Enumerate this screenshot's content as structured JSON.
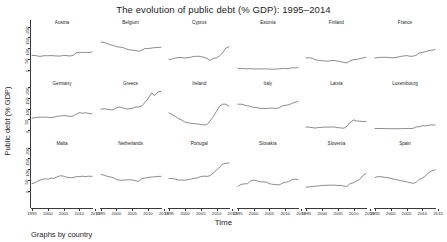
{
  "chart": {
    "title": "The evolution of public debt (% GDP): 1995–2014",
    "xlabel": "Time",
    "ylabel": "Public debt (% GDP)",
    "caption": "Graphs by country"
  },
  "chart_data": {
    "type": "line",
    "title": "The evolution of public debt (% GDP): 1995–2014",
    "xlabel": "Time",
    "ylabel": "Public debt (% GDP)",
    "caption": "Graphs by country",
    "layout": "small-multiples 3 rows × 6 columns, shared axes",
    "grid": false,
    "legend": "none",
    "xlim": [
      1995,
      2014
    ],
    "ylim": [
      0,
      200
    ],
    "xticks": [
      1995,
      2000,
      2005,
      2010,
      2015
    ],
    "yticks": [
      0,
      50,
      100,
      150,
      200
    ],
    "xtick_labels": [
      "1995",
      "2000",
      "2005",
      "2010",
      "2015"
    ],
    "ytick_labels": [
      "0",
      "50",
      "100",
      "150",
      "200"
    ],
    "x": [
      1995,
      1996,
      1997,
      1998,
      1999,
      2000,
      2001,
      2002,
      2003,
      2004,
      2005,
      2006,
      2007,
      2008,
      2009,
      2010,
      2011,
      2012,
      2013,
      2014
    ],
    "series": [
      {
        "name": "Austria",
        "row": 0,
        "col": 0,
        "values": [
          68,
          68,
          64,
          64,
          67,
          66,
          67,
          66,
          65,
          65,
          68,
          67,
          65,
          68,
          80,
          82,
          82,
          82,
          81,
          84
        ]
      },
      {
        "name": "Belgium",
        "row": 0,
        "col": 1,
        "values": [
          130,
          128,
          123,
          117,
          114,
          108,
          107,
          104,
          98,
          94,
          92,
          91,
          87,
          93,
          100,
          100,
          102,
          104,
          105,
          106
        ]
      },
      {
        "name": "Cyprus",
        "row": 0,
        "col": 2,
        "values": [
          49,
          51,
          56,
          58,
          58,
          56,
          57,
          60,
          63,
          64,
          63,
          59,
          54,
          45,
          54,
          56,
          66,
          80,
          102,
          108
        ]
      },
      {
        "name": "Estonia",
        "row": 0,
        "col": 3,
        "values": [
          8,
          7,
          6,
          6,
          6,
          5,
          5,
          5,
          5,
          5,
          4,
          4,
          4,
          5,
          7,
          7,
          6,
          10,
          10,
          11
        ]
      },
      {
        "name": "Finland",
        "row": 0,
        "col": 4,
        "values": [
          56,
          57,
          54,
          48,
          45,
          43,
          42,
          41,
          44,
          44,
          41,
          39,
          35,
          33,
          43,
          48,
          49,
          53,
          56,
          59
        ]
      },
      {
        "name": "France",
        "row": 0,
        "col": 5,
        "values": [
          55,
          58,
          59,
          59,
          59,
          57,
          57,
          59,
          63,
          65,
          67,
          64,
          64,
          68,
          79,
          82,
          85,
          90,
          92,
          95
        ]
      },
      {
        "name": "Germany",
        "row": 1,
        "col": 0,
        "values": [
          55,
          58,
          59,
          60,
          60,
          59,
          58,
          60,
          64,
          65,
          67,
          66,
          63,
          65,
          73,
          81,
          78,
          80,
          77,
          75
        ]
      },
      {
        "name": "Greece",
        "row": 1,
        "col": 1,
        "values": [
          97,
          99,
          96,
          94,
          94,
          104,
          107,
          102,
          98,
          99,
          101,
          107,
          107,
          113,
          130,
          148,
          172,
          160,
          177,
          180
        ]
      },
      {
        "name": "Ireland",
        "row": 1,
        "col": 2,
        "values": [
          80,
          72,
          63,
          53,
          47,
          37,
          34,
          31,
          30,
          28,
          26,
          24,
          24,
          42,
          62,
          86,
          111,
          120,
          120,
          110
        ]
      },
      {
        "name": "Italy",
        "row": 1,
        "col": 3,
        "values": [
          120,
          120,
          116,
          113,
          110,
          105,
          104,
          101,
          100,
          100,
          102,
          102,
          100,
          103,
          112,
          115,
          117,
          123,
          129,
          132
        ]
      },
      {
        "name": "Latvia",
        "row": 1,
        "col": 4,
        "values": [
          14,
          13,
          11,
          9,
          12,
          12,
          14,
          13,
          14,
          14,
          11,
          10,
          8,
          18,
          36,
          47,
          42,
          41,
          39,
          40
        ]
      },
      {
        "name": "Luxembourg",
        "row": 1,
        "col": 5,
        "values": [
          7,
          7,
          7,
          7,
          6,
          6,
          6,
          6,
          6,
          7,
          7,
          7,
          7,
          15,
          15,
          20,
          19,
          22,
          24,
          23
        ]
      },
      {
        "name": "Malta",
        "row": 2,
        "col": 0,
        "values": [
          34,
          39,
          47,
          53,
          57,
          55,
          60,
          59,
          66,
          71,
          69,
          64,
          62,
          62,
          67,
          67,
          69,
          67,
          69,
          68
        ]
      },
      {
        "name": "Netherlands",
        "row": 2,
        "col": 1,
        "values": [
          76,
          74,
          68,
          65,
          61,
          53,
          50,
          50,
          52,
          52,
          51,
          47,
          45,
          58,
          60,
          63,
          65,
          66,
          68,
          68
        ]
      },
      {
        "name": "Portugal",
        "row": 2,
        "col": 2,
        "values": [
          59,
          58,
          55,
          51,
          51,
          50,
          53,
          56,
          59,
          61,
          67,
          69,
          68,
          71,
          83,
          96,
          111,
          125,
          129,
          130
        ]
      },
      {
        "name": "Slovakia",
        "row": 2,
        "col": 3,
        "values": [
          22,
          31,
          33,
          34,
          47,
          50,
          48,
          43,
          42,
          41,
          34,
          31,
          30,
          28,
          36,
          41,
          43,
          52,
          55,
          54
        ]
      },
      {
        "name": "Slovenia",
        "row": 2,
        "col": 4,
        "values": [
          18,
          19,
          21,
          22,
          24,
          26,
          26,
          27,
          27,
          27,
          26,
          26,
          23,
          22,
          35,
          38,
          47,
          54,
          71,
          81
        ]
      },
      {
        "name": "Spain",
        "row": 2,
        "col": 5,
        "values": [
          63,
          67,
          66,
          64,
          62,
          59,
          55,
          52,
          48,
          46,
          43,
          39,
          36,
          40,
          54,
          60,
          70,
          86,
          94,
          98
        ]
      }
    ]
  }
}
